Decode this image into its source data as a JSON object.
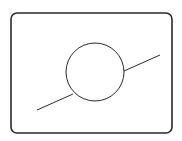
{
  "diagram": {
    "colors": {
      "stroke": "#2a2a2a",
      "background": "#ffffff"
    },
    "frame": {
      "x": 11,
      "y": 13,
      "width": 161,
      "height": 120,
      "radius": 6
    },
    "circle": {
      "cx": 95,
      "cy": 72,
      "r": 29
    },
    "line_segments": [
      {
        "x1": 37,
        "y1": 110,
        "x2": 73,
        "y2": 94
      },
      {
        "x1": 124,
        "y1": 71,
        "x2": 160,
        "y2": 55
      }
    ]
  }
}
